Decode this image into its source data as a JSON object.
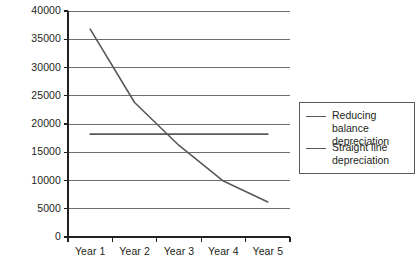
{
  "chart_data": {
    "type": "line",
    "title": "",
    "xlabel": "",
    "ylabel": "",
    "categories": [
      "Year 1",
      "Year 2",
      "Year 3",
      "Year 4",
      "Year 5"
    ],
    "ylim": [
      0,
      40000
    ],
    "ytick_labels": [
      "0",
      "5000",
      "10000",
      "15000",
      "20000",
      "25000",
      "30000",
      "35000",
      "40000"
    ],
    "ytick_values": [
      0,
      5000,
      10000,
      15000,
      20000,
      25000,
      30000,
      35000,
      40000
    ],
    "grid": true,
    "grid_axis": "y",
    "legend_position": "right",
    "series": [
      {
        "name": "Reducing balance depreciation",
        "color": "#58595b",
        "values": [
          36800,
          23800,
          16200,
          9900,
          6200
        ]
      },
      {
        "name": "Straight line depreciation",
        "color": "#58595b",
        "values": [
          18200,
          18200,
          18200,
          18200,
          18200
        ]
      }
    ]
  },
  "legend": {
    "entries": [
      {
        "label": "Reducing balance depreciation"
      },
      {
        "label": "Straight line depreciation"
      }
    ]
  },
  "colors": {
    "axis": "#231f20",
    "grid": "#6d6e71",
    "series": "#58595b",
    "text": "#231f20",
    "background": "#ffffff"
  }
}
